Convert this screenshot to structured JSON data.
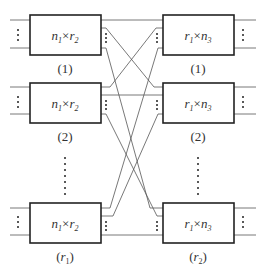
{
  "diagram": {
    "type": "three-stage switching network (first two stages + interconnect)",
    "colors": {
      "stroke": "#222222",
      "line": "#555555",
      "text": "#333333",
      "background": "#ffffff"
    },
    "left_stage": {
      "boxes": [
        {
          "label_main": "n",
          "label_sub1": "1",
          "times": "×",
          "label_main2": "r",
          "label_sub2": "2",
          "index": "(1)"
        },
        {
          "label_main": "n",
          "label_sub1": "1",
          "times": "×",
          "label_main2": "r",
          "label_sub2": "2",
          "index": "(2)"
        },
        {
          "label_main": "n",
          "label_sub1": "1",
          "times": "×",
          "label_main2": "r",
          "label_sub2": "2",
          "index_main": "r",
          "index_sub": "1"
        }
      ]
    },
    "right_stage": {
      "boxes": [
        {
          "label_main": "r",
          "label_sub1": "1",
          "times": "×",
          "label_main2": "n",
          "label_sub2": "3",
          "index": "(1)"
        },
        {
          "label_main": "r",
          "label_sub1": "1",
          "times": "×",
          "label_main2": "n",
          "label_sub2": "3",
          "index": "(2)"
        },
        {
          "label_main": "r",
          "label_sub1": "1",
          "times": "×",
          "label_main2": "n",
          "label_sub2": "3",
          "index_main": "r",
          "index_sub": "2"
        }
      ]
    },
    "ellipsis": "⋮"
  }
}
